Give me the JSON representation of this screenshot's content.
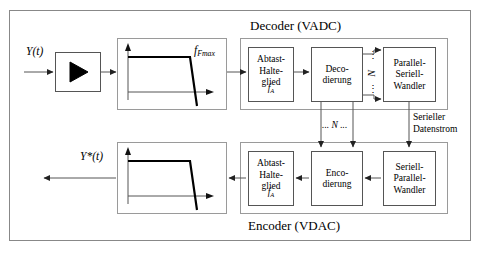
{
  "diagram": {
    "decoder_title": "Decoder (VADC)",
    "encoder_title": "Encoder (VDAC)",
    "input_signal_label": "Y(t)",
    "output_signal_label": "Y*(t)",
    "filter_corner_label_main": "f",
    "filter_corner_label_sub": "Fmax",
    "sample_hold_label": "Abtast-\nHalte-\nglied",
    "sample_hold_freq_main": "f",
    "sample_hold_freq_sub": "A",
    "decoding_label": "Deco-\ndierung",
    "encoding_label": "Enco-\ndierung",
    "parallel_serial_label": "Parallel-\nSeriell-\nWandler",
    "serial_parallel_label": "Seriell-\nParallel-\nWandler",
    "serial_stream_label": "Serieller\nDatenstrom",
    "bus_n_label_vertical": "N",
    "bus_n_label_horizontal": "... N ...",
    "bus_dots_top": "⋮",
    "bus_dots_bottom": "⋮",
    "amplifier_icon": "triangle-amplifier",
    "colors": {
      "line": "#555555",
      "frame": "#9a9a9a",
      "outer_frame": "#888888",
      "curve": "#000000",
      "background": "#ffffff"
    }
  }
}
